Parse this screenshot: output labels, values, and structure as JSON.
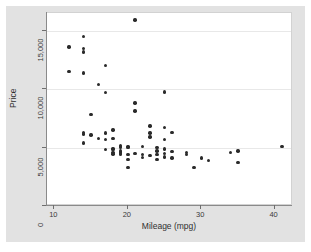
{
  "figure": {
    "background_color": "#e2e2e2",
    "plot_background_color": "#ffffff",
    "gridline_color": "#e8e8e8",
    "marker_color": "#2a2a2a",
    "corner_text": ""
  },
  "chart_data": {
    "type": "scatter",
    "title": "",
    "xlabel": "Mileage (mpg)",
    "ylabel": "Price",
    "xlim": [
      9,
      42.5
    ],
    "ylim": [
      0,
      16500
    ],
    "xticks": [
      10,
      20,
      30,
      40
    ],
    "xtick_labels": [
      "10",
      "20",
      "30",
      "40"
    ],
    "yticks": [
      0,
      5000,
      10000,
      15000
    ],
    "ytick_labels": [
      "0",
      "5,000",
      "10,000",
      "15,000"
    ],
    "grid": "horizontal",
    "gridline_values": [
      5000,
      10000,
      15000
    ],
    "legend": null,
    "series": [
      {
        "name": "Price vs Mileage",
        "marker": "circle",
        "points": [
          [
            12,
            13594
          ],
          [
            12,
            11497
          ],
          [
            14,
            14500
          ],
          [
            14,
            13466
          ],
          [
            14,
            13162
          ],
          [
            14,
            11385
          ],
          [
            14,
            6303
          ],
          [
            14,
            6165
          ],
          [
            14,
            5379
          ],
          [
            15,
            7827
          ],
          [
            15,
            6086
          ],
          [
            16,
            10372
          ],
          [
            16,
            5788
          ],
          [
            17,
            11995
          ],
          [
            17,
            9690
          ],
          [
            17,
            6229
          ],
          [
            17,
            5705
          ],
          [
            17,
            4816
          ],
          [
            18,
            6486
          ],
          [
            18,
            5799
          ],
          [
            18,
            4934
          ],
          [
            18,
            4816
          ],
          [
            18,
            4589
          ],
          [
            18,
            4453
          ],
          [
            19,
            5189
          ],
          [
            19,
            5079
          ],
          [
            19,
            4995
          ],
          [
            19,
            4697
          ],
          [
            19,
            4589
          ],
          [
            19,
            4482
          ],
          [
            19,
            4424
          ],
          [
            20,
            5104
          ],
          [
            20,
            4987
          ],
          [
            20,
            4424
          ],
          [
            20,
            3984
          ],
          [
            20,
            3291
          ],
          [
            21,
            15906
          ],
          [
            21,
            8814
          ],
          [
            21,
            8129
          ],
          [
            21,
            4504
          ],
          [
            22,
            5079
          ],
          [
            22,
            4424
          ],
          [
            22,
            4172
          ],
          [
            23,
            6850
          ],
          [
            23,
            6229
          ],
          [
            23,
            5899
          ],
          [
            23,
            4296
          ],
          [
            24,
            5005
          ],
          [
            24,
            4723
          ],
          [
            24,
            4424
          ],
          [
            24,
            3995
          ],
          [
            25,
            9735
          ],
          [
            25,
            6692
          ],
          [
            25,
            5705
          ],
          [
            25,
            4890
          ],
          [
            25,
            4499
          ],
          [
            25,
            4187
          ],
          [
            26,
            6295
          ],
          [
            26,
            4647
          ],
          [
            26,
            4099
          ],
          [
            28,
            4589
          ],
          [
            28,
            4425
          ],
          [
            29,
            3299
          ],
          [
            30,
            4099
          ],
          [
            31,
            3895
          ],
          [
            34,
            4589
          ],
          [
            35,
            4697
          ],
          [
            35,
            3748
          ],
          [
            41,
            5079
          ]
        ]
      }
    ]
  }
}
